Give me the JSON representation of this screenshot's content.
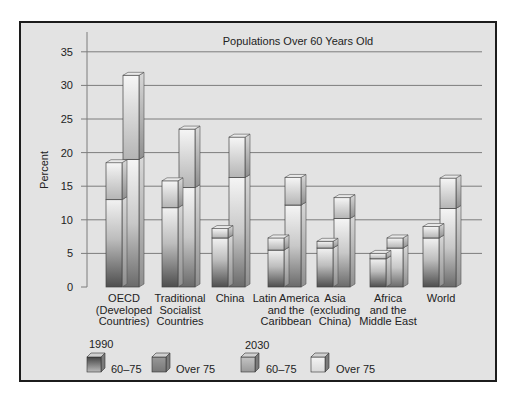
{
  "chart_data": {
    "type": "bar",
    "title": "Populations Over 60 Years Old",
    "xlabel": "",
    "ylabel": "Percent",
    "ylim": [
      0,
      35
    ],
    "yticks": [
      0,
      5,
      10,
      15,
      20,
      25,
      30,
      35
    ],
    "grid": true,
    "stacked": true,
    "categories": [
      "OECD (Developed Countries)",
      "Traditional Socialist Countries",
      "China",
      "Latin America and the Caribbean",
      "Asia (excluding China)",
      "Africa and the Middle East",
      "World"
    ],
    "category_lines": [
      [
        "OECD",
        "(Developed",
        "Countries)"
      ],
      [
        "Traditional",
        "Socialist",
        "Countries"
      ],
      [
        "China"
      ],
      [
        "Latin America",
        "and the",
        "Caribbean"
      ],
      [
        "Asia",
        "(excluding",
        "China)"
      ],
      [
        "Africa",
        "and the",
        "Middle East"
      ],
      [
        "World"
      ]
    ],
    "series": [
      {
        "name": "1990 60–75",
        "year": "1990",
        "group": "60–75",
        "values": [
          13.0,
          11.8,
          7.3,
          5.5,
          5.8,
          4.2,
          7.3
        ]
      },
      {
        "name": "1990 Over 75",
        "year": "1990",
        "group": "Over 75",
        "values": [
          5.5,
          4.0,
          1.4,
          1.8,
          1.0,
          0.8,
          1.7
        ]
      },
      {
        "name": "2030 60–75",
        "year": "2030",
        "group": "60–75",
        "values": [
          19.0,
          14.8,
          16.3,
          12.2,
          10.2,
          5.8,
          11.7
        ]
      },
      {
        "name": "2030 Over 75",
        "year": "2030",
        "group": "Over 75",
        "values": [
          12.5,
          8.7,
          6.0,
          4.1,
          3.1,
          1.5,
          4.5
        ]
      }
    ],
    "totals": {
      "1990": [
        18.5,
        15.8,
        8.7,
        7.3,
        6.8,
        5.0,
        9.0
      ],
      "2030": [
        31.5,
        23.5,
        22.3,
        16.3,
        13.3,
        7.3,
        16.2
      ]
    },
    "legend": {
      "position": "bottom-left",
      "groups": [
        {
          "year": "1990",
          "items": [
            "60–75",
            "Over 75"
          ]
        },
        {
          "year": "2030",
          "items": [
            "60–75",
            "Over 75"
          ]
        }
      ]
    }
  },
  "legend": {
    "y1990": "1990",
    "y2030": "2030",
    "a": "60–75",
    "b": "Over 75",
    "c": "60–75",
    "d": "Over 75"
  },
  "colors": {
    "background": "#e3e3e3",
    "frame": "#1c1c1c",
    "grid": "#8a8a8a",
    "bar_dark_bottom": "#5a5a5a",
    "bar_light_top": "#f4f4f4"
  }
}
